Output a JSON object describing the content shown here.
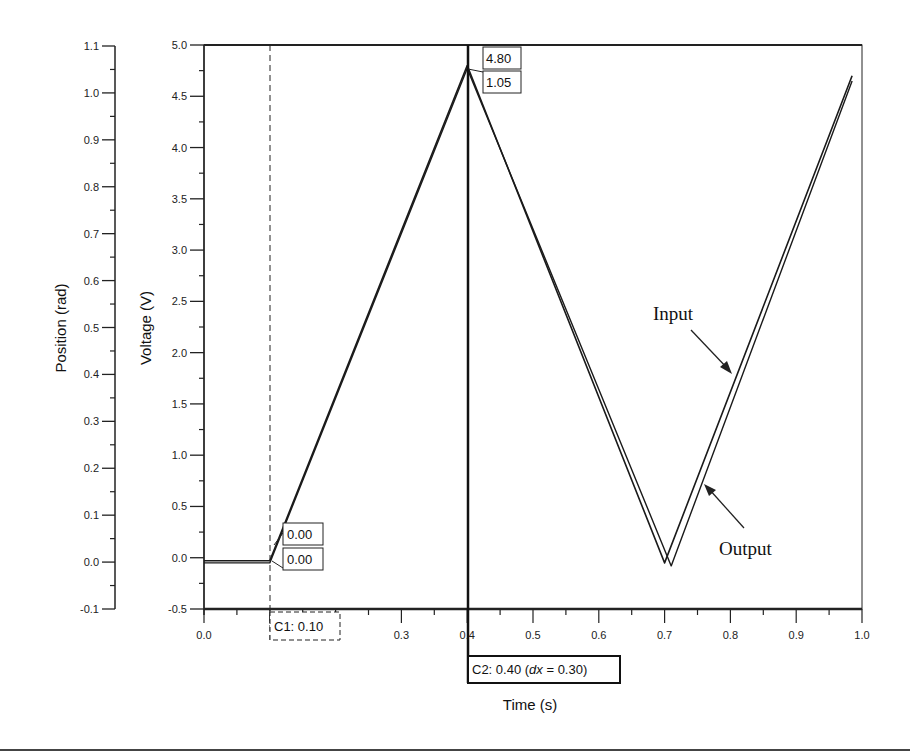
{
  "chart_data": {
    "type": "line",
    "title": "",
    "xlabel": "Time (s)",
    "ylabel": "Voltage (V)",
    "y2label": "Position (rad)",
    "xlim": [
      0.0,
      1.0
    ],
    "ylim": [
      -0.5,
      5.0
    ],
    "y2lim": [
      -0.1,
      1.1
    ],
    "grid": false,
    "legend": "annotations",
    "x_ticks": [
      "0.0",
      "0.1",
      "0.2",
      "0.3",
      "0.4",
      "0.5",
      "0.6",
      "0.7",
      "0.8",
      "0.9",
      "1.0"
    ],
    "x_tick_labels_visible": [
      "0.0",
      "0.3",
      "0.4",
      "0.5",
      "0.6",
      "0.7",
      "0.8",
      "0.9",
      "1.0"
    ],
    "y_ticks": [
      "-0.5",
      "0.0",
      "0.5",
      "1.0",
      "1.5",
      "2.0",
      "2.5",
      "3.0",
      "3.5",
      "4.0",
      "4.5",
      "5.0"
    ],
    "y2_ticks": [
      "-0.1",
      "0.0",
      "0.1",
      "0.2",
      "0.3",
      "0.4",
      "0.5",
      "0.6",
      "0.7",
      "0.8",
      "0.9",
      "1.0",
      "1.1"
    ],
    "series": [
      {
        "name": "Input",
        "x": [
          0.0,
          0.1,
          0.4,
          0.7,
          0.985
        ],
        "y": [
          -0.03,
          -0.03,
          4.8,
          -0.05,
          4.7
        ]
      },
      {
        "name": "Output",
        "x": [
          0.0,
          0.1,
          0.4,
          0.71,
          0.985
        ],
        "y": [
          -0.05,
          -0.05,
          4.77,
          -0.08,
          4.65
        ]
      }
    ],
    "cursors": [
      {
        "name": "C1",
        "x": 0.1,
        "label": "C1: 0.10",
        "style": "dashed",
        "values": [
          "0.00",
          "0.00"
        ]
      },
      {
        "name": "C2",
        "x": 0.4,
        "label": "C2: 0.40 (dx = 0.30)",
        "style": "solid",
        "values": [
          "4.80",
          "1.05"
        ]
      }
    ],
    "annotations": [
      {
        "text": "Input",
        "points_to": [
          0.8,
          2.1
        ]
      },
      {
        "text": "Output",
        "points_to": [
          0.76,
          0.85
        ]
      }
    ]
  },
  "labels": {
    "xlabel": "Time (s)",
    "ylabel": "Voltage (V)",
    "y2label": "Position (rad)",
    "c1_label_prefix": "C1: 0.10",
    "c2_label_prefix": "C2: 0.40 (",
    "c2_label_dx": "dx",
    "c2_label_suffix": " = 0.30)",
    "c1_value_top": "0.00",
    "c1_value_bottom": "0.00",
    "c2_value_top": "4.80",
    "c2_value_bottom": "1.05",
    "input_annotation": "Input",
    "output_annotation": "Output"
  }
}
